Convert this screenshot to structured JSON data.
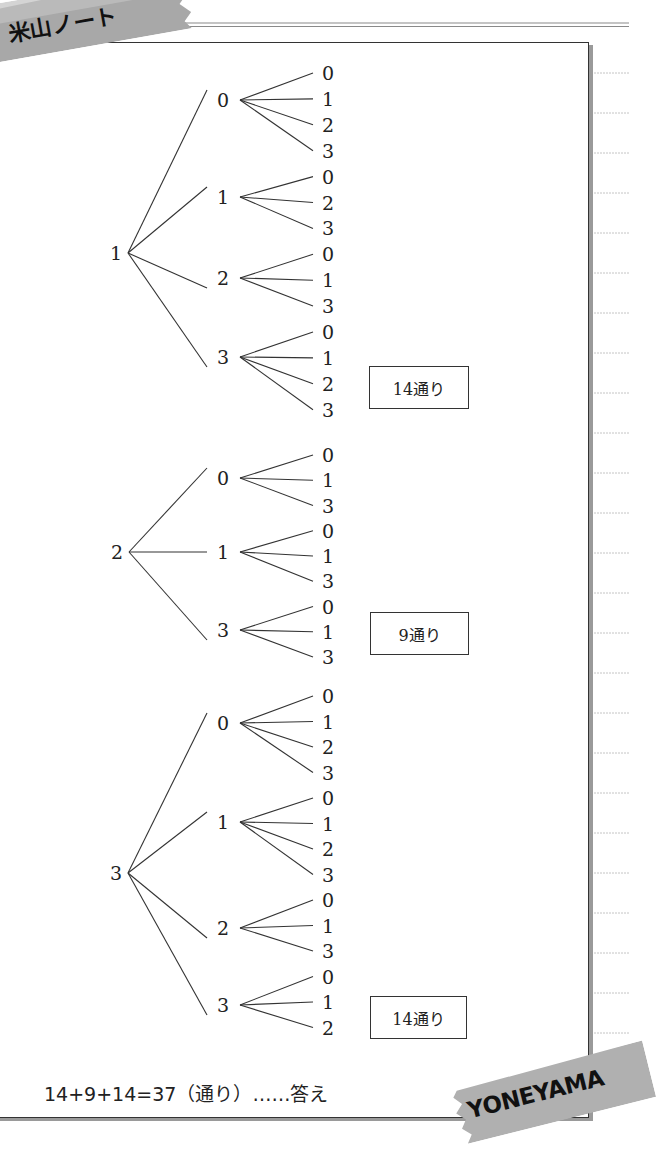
{
  "header": {
    "title": "米山ノート"
  },
  "colors": {
    "tape": "#a9a9a9",
    "tape_light": "#c8c8c8",
    "line": "#333333",
    "notebook_rule": "#bdbdbd"
  },
  "trees": [
    {
      "root": "1",
      "root_pos": [
        122,
        253
      ],
      "branches": [
        {
          "label": "0",
          "y": 100,
          "leaves": [
            "0",
            "1",
            "2",
            "3"
          ]
        },
        {
          "label": "1",
          "y": 197,
          "leaves": [
            "0",
            "2",
            "3"
          ]
        },
        {
          "label": "2",
          "y": 278,
          "leaves": [
            "0",
            "1",
            "3"
          ]
        },
        {
          "label": "3",
          "y": 357,
          "leaves": [
            "0",
            "1",
            "2",
            "3"
          ]
        }
      ],
      "leaf_start_y": 73,
      "leaf_step": 25.9,
      "count_label": "14通り",
      "count_box": {
        "x": 369,
        "y": 366,
        "w": 100,
        "h": 43
      }
    },
    {
      "root": "2",
      "root_pos": [
        123,
        552
      ],
      "branches": [
        {
          "label": "0",
          "y": 478,
          "leaves": [
            "0",
            "1",
            "3"
          ]
        },
        {
          "label": "1",
          "y": 552,
          "leaves": [
            "0",
            "1",
            "3"
          ]
        },
        {
          "label": "3",
          "y": 630,
          "leaves": [
            "0",
            "1",
            "3"
          ]
        }
      ],
      "leaf_start_y": 455,
      "leaf_step": 25.25,
      "count_label": "9通り",
      "count_box": {
        "x": 370,
        "y": 612,
        "w": 99,
        "h": 43
      }
    },
    {
      "root": "3",
      "root_pos": [
        122,
        873
      ],
      "branches": [
        {
          "label": "0",
          "y": 723,
          "leaves": [
            "0",
            "1",
            "2",
            "3"
          ]
        },
        {
          "label": "1",
          "y": 822,
          "leaves": [
            "0",
            "1",
            "2",
            "3"
          ]
        },
        {
          "label": "2",
          "y": 928,
          "leaves": [
            "0",
            "1",
            "3"
          ]
        },
        {
          "label": "3",
          "y": 1005,
          "leaves": [
            "0",
            "1",
            "2"
          ]
        }
      ],
      "leaf_start_y": 696,
      "leaf_step": 25.5,
      "count_label": "14通り",
      "count_box": {
        "x": 370,
        "y": 996,
        "w": 97,
        "h": 43
      }
    }
  ],
  "answer": {
    "text": "14+9+14=37（通り）……答え"
  },
  "stamp": {
    "text": "YONEYAMA"
  }
}
